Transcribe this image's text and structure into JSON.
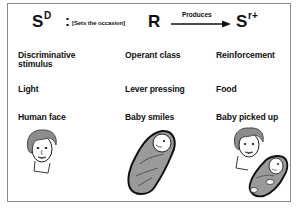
{
  "header": {
    "stimulus_symbol": "S",
    "stimulus_superscript": "D",
    "colon": ":",
    "relation_label": "[Sets the occasion]",
    "response_symbol": "R",
    "arrow_label": "Produces",
    "reinforcer_symbol": "S",
    "reinforcer_superscript": "r+"
  },
  "columns": [
    {
      "heading": "Discriminative",
      "heading_line2": "stimulus",
      "example1": "Light",
      "example2": "Human face",
      "illustration": "woman-face-icon"
    },
    {
      "heading": "Operant class",
      "heading_line2": "",
      "example1": "Lever pressing",
      "example2": "Baby smiles",
      "illustration": "swaddled-baby-icon"
    },
    {
      "heading": "Reinforcement",
      "heading_line2": "",
      "example1": "Food",
      "example2": "Baby picked up",
      "illustration": "woman-holding-baby-icon"
    }
  ],
  "colors": {
    "border": "#8a8a8a",
    "text": "#111111",
    "hair": "#8c8c8c",
    "blanket": "#9a9a9a"
  }
}
